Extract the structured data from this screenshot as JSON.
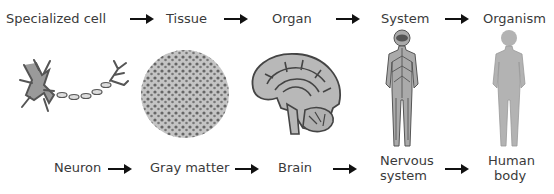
{
  "top_row": {
    "labels": [
      "Specialized cell",
      "Tissue",
      "Organ",
      "System",
      "Organism"
    ]
  },
  "bottom_row": {
    "labels": [
      "Neuron",
      "Gray matter",
      "Brain",
      "Nervous system",
      "Human body"
    ],
    "nervous_line1": "Nervous",
    "nervous_line2": "system",
    "human_line1": "Human",
    "human_line2": "body"
  },
  "illustrations": [
    "neuron",
    "gray-matter-tissue",
    "brain",
    "nervous-system-figure",
    "human-body-figure"
  ],
  "colors": {
    "text": "#3a3a3a",
    "arrow": "#111111",
    "fill": "#b3b3b3",
    "stroke": "#555555"
  }
}
